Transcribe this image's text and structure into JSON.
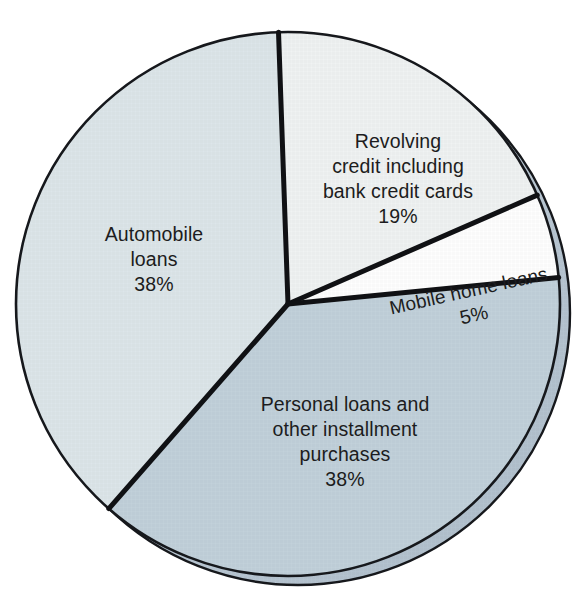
{
  "chart_data": {
    "type": "pie",
    "title": "",
    "subtitle": "",
    "xlabel": "",
    "ylabel": "",
    "legend_position": "none",
    "grid": false,
    "labels_inside_slices": true,
    "total": 100,
    "units": "percent",
    "categories": [
      "Automobile loans",
      "Revolving credit including bank credit cards",
      "Mobile home loans",
      "Personal loans and other installment purchases"
    ],
    "values": [
      38,
      19,
      5,
      38
    ],
    "slices": [
      {
        "key": "revolving-credit",
        "lines": [
          "Revolving",
          "credit including",
          "bank credit cards"
        ],
        "value": 19,
        "value_label": "19%",
        "color": "#f0f3f3",
        "start_angle": -92,
        "end_angle": -23.6,
        "label_x": 398,
        "label_y": 148,
        "label_rotation": 0,
        "line_height": 25
      },
      {
        "key": "mobile-home-loans",
        "lines": [
          "Mobile home loans"
        ],
        "value": 5,
        "value_label": "5%",
        "color": "#ffffff",
        "start_angle": -23.6,
        "end_angle": -5.6,
        "label_x": 470,
        "label_y": 297,
        "label_rotation": -12.5,
        "line_height": 25
      },
      {
        "key": "personal-loans",
        "lines": [
          "Personal loans and",
          "other installment",
          "purchases"
        ],
        "value": 38,
        "value_label": "38%",
        "color": "#c2d1db",
        "start_angle": -5.6,
        "end_angle": 131.2,
        "label_x": 345,
        "label_y": 411,
        "label_rotation": 0,
        "line_height": 25
      },
      {
        "key": "automobile-loans",
        "lines": [
          "Automobile",
          "loans"
        ],
        "value": 38,
        "value_label": "38%",
        "color": "#dde6ea",
        "start_angle": 131.2,
        "end_angle": 268,
        "label_x": 154,
        "label_y": 241,
        "label_rotation": 0,
        "line_height": 25
      }
    ],
    "geometry": {
      "center_x": 298,
      "center_y": 313,
      "radius": 272,
      "depth_offset_x": -10,
      "depth_offset_y": -9
    },
    "colors": {
      "background": "#ffffff",
      "rim": "#b9c7d2",
      "outline": "#16181c",
      "divider": "#101114",
      "text": "#1c1c20"
    }
  }
}
